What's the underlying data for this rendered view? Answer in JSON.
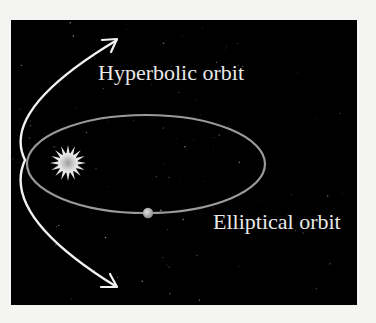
{
  "diagram": {
    "type": "orbits",
    "labels": {
      "hyperbolic": "Hyperbolic orbit",
      "elliptical": "Elliptical orbit"
    },
    "elements": [
      {
        "name": "sun",
        "description": "star at focus of both orbits"
      },
      {
        "name": "planet",
        "description": "body on elliptical orbit"
      },
      {
        "name": "elliptical-orbit",
        "description": "closed elliptical path around the sun"
      },
      {
        "name": "hyperbolic-orbit",
        "description": "open path passing near the sun, arrows at both ends"
      }
    ],
    "colors": {
      "background": "#000000",
      "page": "#f4f4f2",
      "hyperbola": "#f2f2f2",
      "ellipse": "#9a9a9a",
      "sun": "#c8c8c8",
      "planet": "#bdbdbd",
      "label": "#e8e8e8"
    }
  }
}
